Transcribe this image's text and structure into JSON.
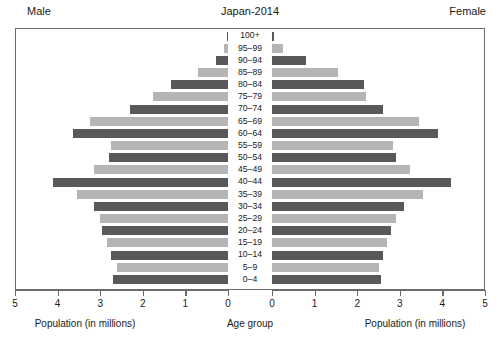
{
  "header": {
    "left_label": "Male",
    "title": "Japan-2014",
    "right_label": "Female"
  },
  "axes": {
    "left_title": "Population (in millions)",
    "center_title": "Age group",
    "right_title": "Population (in millions)",
    "left_ticks": [
      "5",
      "4",
      "3",
      "2",
      "1",
      "0"
    ],
    "right_ticks": [
      "0",
      "1",
      "2",
      "3",
      "4",
      "5"
    ]
  },
  "colors": {
    "bar_dark": "#595959",
    "bar_light": "#b5b5b5",
    "frame": "#6b6b6b",
    "text": "#1a1a1a",
    "background": "#ffffff"
  },
  "chart_data": {
    "type": "bar",
    "subtype": "population-pyramid",
    "title": "Japan-2014",
    "xlabel": "Population (in millions)",
    "ylabel": "Age group",
    "xlim": [
      0,
      5
    ],
    "grid": false,
    "legend": "none",
    "categories": [
      "100+",
      "95-99",
      "90-94",
      "85-89",
      "80-84",
      "75-79",
      "70-74",
      "65-69",
      "60-64",
      "55-59",
      "50-54",
      "45-49",
      "40-44",
      "35-39",
      "30-34",
      "25-29",
      "20-24",
      "15-19",
      "10-14",
      "5-9",
      "0-4"
    ],
    "series": [
      {
        "name": "Male",
        "side": "left",
        "values": [
          0.01,
          0.09,
          0.29,
          0.7,
          1.35,
          1.75,
          2.3,
          3.25,
          3.65,
          2.75,
          2.8,
          3.15,
          4.1,
          3.55,
          3.15,
          3.0,
          2.95,
          2.85,
          2.75,
          2.6,
          2.7
        ]
      },
      {
        "name": "Female",
        "side": "right",
        "values": [
          0.05,
          0.25,
          0.8,
          1.55,
          2.15,
          2.2,
          2.6,
          3.45,
          3.9,
          2.85,
          2.9,
          3.25,
          4.2,
          3.55,
          3.1,
          2.9,
          2.8,
          2.7,
          2.6,
          2.5,
          2.55
        ]
      }
    ]
  }
}
